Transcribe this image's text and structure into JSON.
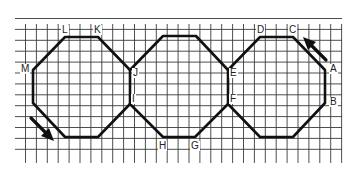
{
  "diagram": {
    "type": "grid path of three joined octagons",
    "grid": {
      "x_start": 15,
      "x_end": 342,
      "y_start": 8,
      "y_end": 163,
      "spacing": 10.9,
      "color": "#3a3a3a"
    },
    "path_color": "#111111",
    "vertices": {
      "A": [
        325,
        70
      ],
      "B": [
        325,
        103
      ],
      "C": [
        293,
        37
      ],
      "D": [
        260,
        37
      ],
      "E": [
        228,
        70
      ],
      "F": [
        228,
        104
      ],
      "G": [
        195,
        137
      ],
      "H": [
        163,
        137
      ],
      "I": [
        130,
        104
      ],
      "J": [
        130,
        70
      ],
      "K": [
        98,
        37
      ],
      "L": [
        65,
        37
      ],
      "M": [
        33,
        70
      ]
    },
    "labels": [
      {
        "id": "A",
        "text": "A",
        "x": 329,
        "y": 64
      },
      {
        "id": "B",
        "text": "B",
        "x": 329,
        "y": 97
      },
      {
        "id": "C",
        "text": "C",
        "x": 288,
        "y": 25
      },
      {
        "id": "D",
        "text": "D",
        "x": 256,
        "y": 25
      },
      {
        "id": "E",
        "text": "E",
        "x": 229,
        "y": 68
      },
      {
        "id": "F",
        "text": "F",
        "x": 229,
        "y": 94
      },
      {
        "id": "G",
        "text": "G",
        "x": 190,
        "y": 141
      },
      {
        "id": "H",
        "text": "H",
        "x": 158,
        "y": 141
      },
      {
        "id": "I",
        "text": "I",
        "x": 131,
        "y": 94
      },
      {
        "id": "J",
        "text": "J",
        "x": 132,
        "y": 68
      },
      {
        "id": "K",
        "text": "K",
        "x": 93,
        "y": 25
      },
      {
        "id": "L",
        "text": "L",
        "x": 61,
        "y": 25
      },
      {
        "id": "M",
        "text": "M",
        "x": 20,
        "y": 64
      }
    ],
    "arrows": [
      {
        "id": "arrow-top-right",
        "direction": "up-left",
        "from": [
          326,
          60
        ],
        "to": [
          303,
          37
        ]
      },
      {
        "id": "arrow-bottom-left",
        "direction": "down-right",
        "from": [
          31,
          118
        ],
        "to": [
          54,
          141
        ]
      }
    ]
  }
}
